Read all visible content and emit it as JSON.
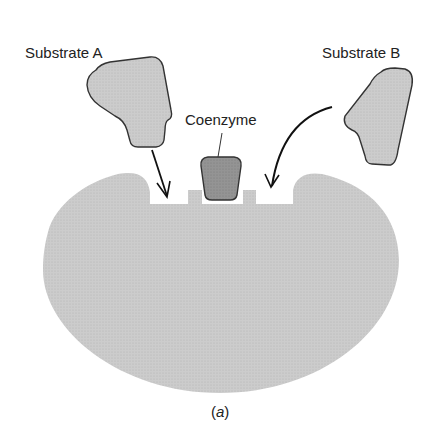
{
  "figure": {
    "caption_open": "(",
    "caption_letter": "a",
    "caption_close": ")"
  },
  "labels": {
    "substrate_a": "Substrate A",
    "substrate_b": "Substrate B",
    "coenzyme": "Coenzyme"
  },
  "colors": {
    "enzyme_fill": "#c8c8c8",
    "substrate_fill": "#cfcfcf",
    "coenzyme_fill": "#8f8f8f",
    "outline": "#333333",
    "arrow": "#111111",
    "text": "#222222"
  }
}
